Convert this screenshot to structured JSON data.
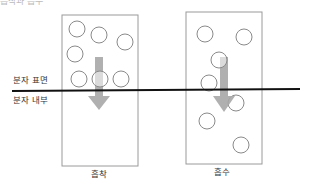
{
  "title_partial": "흡착과 흡수",
  "labels": {
    "surface": "분자 표면",
    "interior": "분자 내부"
  },
  "panels": [
    {
      "id": "adsorption",
      "caption": "흡착",
      "box": {
        "x": 62,
        "y": 15,
        "w": 76,
        "h": 151
      },
      "molecules": [
        {
          "cx": 77,
          "cy": 29
        },
        {
          "cx": 99,
          "cy": 35
        },
        {
          "cx": 125,
          "cy": 42
        },
        {
          "cx": 75,
          "cy": 54
        },
        {
          "cx": 79,
          "cy": 79
        },
        {
          "cx": 100,
          "cy": 79
        },
        {
          "cx": 121,
          "cy": 79
        }
      ],
      "arrow": {
        "x": 99,
        "y_start": 57,
        "y_end": 110
      }
    },
    {
      "id": "absorption",
      "caption": "흡수",
      "box": {
        "x": 186,
        "y": 12,
        "w": 76,
        "h": 152
      },
      "molecules": [
        {
          "cx": 205,
          "cy": 34
        },
        {
          "cx": 244,
          "cy": 37
        },
        {
          "cx": 219,
          "cy": 60
        },
        {
          "cx": 209,
          "cy": 83
        },
        {
          "cx": 236,
          "cy": 103
        },
        {
          "cx": 207,
          "cy": 121
        },
        {
          "cx": 241,
          "cy": 145
        }
      ],
      "arrow": {
        "x": 224,
        "y_start": 57,
        "y_end": 112
      }
    }
  ],
  "surface_line": {
    "x1": 12,
    "y1": 91,
    "x2": 300,
    "y2": 89
  },
  "colors": {
    "box_stroke": "#9a9a9a",
    "molecule_stroke": "#8a8a8a",
    "arrow_fill": "#a8a8a8",
    "line": "#111111",
    "text": "#333333"
  }
}
